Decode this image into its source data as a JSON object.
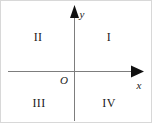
{
  "figure": {
    "name": "cartesian-coordinate-plane-quadrants",
    "width": 152,
    "height": 123,
    "background_color": "#ffffff",
    "ink_color": "#1a1a1a",
    "axis_line_color": "#808080",
    "border_color": "#d8d8d8"
  },
  "axes": {
    "y_axis": {
      "label": "y",
      "orientation": "vertical",
      "x": 73,
      "y_top": 5,
      "y_bottom": 120,
      "arrow_at": "top",
      "label_x": 81,
      "label_y": 13
    },
    "x_axis": {
      "label": "x",
      "orientation": "horizontal",
      "y": 70,
      "x_left": 7,
      "x_right": 143,
      "arrow_at": "right",
      "label_x": 138,
      "label_y": 84
    },
    "origin": {
      "label": "O",
      "x": 73,
      "y": 70,
      "label_x": 63,
      "label_y": 79
    }
  },
  "quadrants": [
    {
      "label": "I",
      "x": 108,
      "y": 36
    },
    {
      "label": "II",
      "x": 37,
      "y": 36
    },
    {
      "label": "III",
      "x": 38,
      "y": 102
    },
    {
      "label": "IV",
      "x": 108,
      "y": 102
    }
  ]
}
